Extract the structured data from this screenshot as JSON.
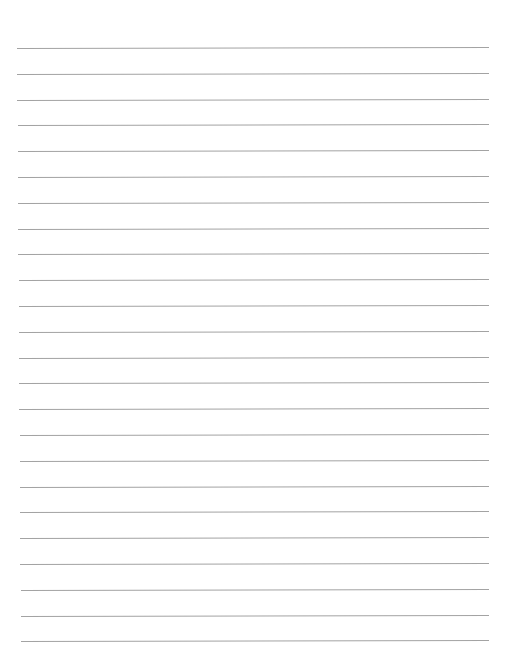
{
  "page": {
    "type": "lined-paper",
    "background_color": "#ffffff",
    "line_color": "#a3a3a3",
    "line_count": 24,
    "first_line_y": 48,
    "line_spacing": 25.8,
    "line_left_x": 17,
    "line_right_x": 489,
    "line_tilt_deg": -0.12,
    "text": ""
  }
}
